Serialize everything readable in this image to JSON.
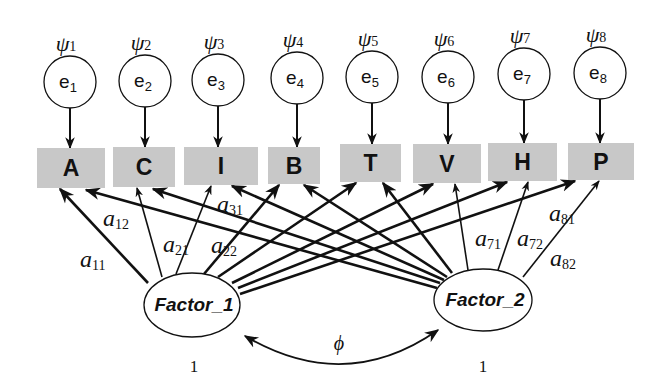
{
  "diagram": {
    "type": "confirmatory factor analysis path diagram",
    "errors": [
      {
        "label": "e",
        "sub": "1",
        "variance_symbol": "ψ",
        "variance_sub": "1"
      },
      {
        "label": "e",
        "sub": "2",
        "variance_symbol": "ψ",
        "variance_sub": "2"
      },
      {
        "label": "e",
        "sub": "3",
        "variance_symbol": "ψ",
        "variance_sub": "3"
      },
      {
        "label": "e",
        "sub": "4",
        "variance_symbol": "ψ",
        "variance_sub": "4"
      },
      {
        "label": "e",
        "sub": "5",
        "variance_symbol": "ψ",
        "variance_sub": "5"
      },
      {
        "label": "e",
        "sub": "6",
        "variance_symbol": "ψ",
        "variance_sub": "6"
      },
      {
        "label": "e",
        "sub": "7",
        "variance_symbol": "ψ",
        "variance_sub": "7"
      },
      {
        "label": "e",
        "sub": "8",
        "variance_symbol": "ψ",
        "variance_sub": "8"
      }
    ],
    "indicators": [
      "A",
      "C",
      "I",
      "B",
      "T",
      "V",
      "H",
      "P"
    ],
    "factors": [
      {
        "label": "Factor_1",
        "variance": "1"
      },
      {
        "label": "Factor_2",
        "variance": "1"
      }
    ],
    "loading_labels": [
      {
        "sym": "a",
        "sub": "11"
      },
      {
        "sym": "a",
        "sub": "12"
      },
      {
        "sym": "a",
        "sub": "21"
      },
      {
        "sym": "a",
        "sub": "22"
      },
      {
        "sym": "a",
        "sub": "31"
      },
      {
        "sym": "a",
        "sub": "71"
      },
      {
        "sym": "a",
        "sub": "72"
      },
      {
        "sym": "a",
        "sub": "81"
      },
      {
        "sym": "a",
        "sub": "82"
      }
    ],
    "covariance_label": "ϕ",
    "colors": {
      "indicator_fill": "#c8c8c8",
      "line": "#111111",
      "background": "#ffffff"
    }
  }
}
